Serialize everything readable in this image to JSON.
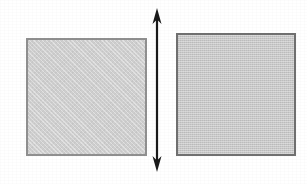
{
  "figure": {
    "title": "Two shaded squares separated by a vertical double-headed arrow",
    "background_color": "#ffffff",
    "width": 307,
    "height": 184,
    "shapes": [
      {
        "id": "square-left",
        "name": "left square",
        "type": "square",
        "x": 26,
        "y": 38,
        "width": 121,
        "height": 118,
        "fill_color": "#cfcfcf",
        "border_color": "#8f8f8f",
        "border_width": 2,
        "fill_pattern": "light halftone crosshatch"
      },
      {
        "id": "square-right",
        "name": "right square",
        "type": "square",
        "x": 176,
        "y": 33,
        "width": 120,
        "height": 123,
        "fill_color": "#c8c8c8",
        "border_color": "#707070",
        "border_width": 2,
        "fill_pattern": "fine dotted halftone"
      }
    ],
    "arrow": {
      "id": "double-arrow",
      "name": "vertical double headed arrow",
      "type": "double-headed-arrow",
      "orientation": "vertical",
      "color": "#1a1a1a",
      "center_x": 157,
      "top_y": 8,
      "bottom_y": 172,
      "shaft_width": 2,
      "head_width": 9,
      "head_length": 16
    },
    "labels": []
  }
}
